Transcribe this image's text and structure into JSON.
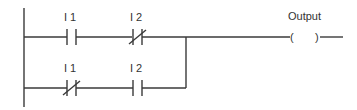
{
  "diagram": {
    "type": "ladder-logic",
    "rungs": [
      {
        "contacts": [
          {
            "label": "I 1",
            "type": "normally-open"
          },
          {
            "label": "I 2",
            "type": "normally-closed"
          }
        ]
      },
      {
        "contacts": [
          {
            "label": "I 1",
            "type": "normally-closed"
          },
          {
            "label": "I 2",
            "type": "normally-open"
          }
        ]
      }
    ],
    "output": {
      "label": "Output",
      "coil_open": "(",
      "coil_close": ")"
    },
    "line_color": "#3a3a3a"
  }
}
